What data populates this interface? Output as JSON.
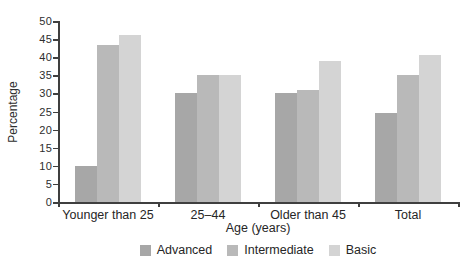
{
  "chart_data": {
    "type": "bar",
    "categories": [
      "Younger than 25",
      "25–44",
      "Older than 45",
      "Total"
    ],
    "series": [
      {
        "name": "Advanced",
        "color": "#a7a7a7",
        "values": [
          10,
          30,
          30,
          24.5
        ]
      },
      {
        "name": "Intermediate",
        "color": "#b9b9b9",
        "values": [
          43.5,
          35,
          31,
          35
        ]
      },
      {
        "name": "Basic",
        "color": "#d4d4d4",
        "values": [
          46,
          35,
          39,
          40.5
        ]
      }
    ],
    "title": "",
    "xlabel": "Age (years)",
    "ylabel": "Percentage",
    "ylim": [
      0,
      50
    ],
    "ytick_step": 5,
    "yticks": [
      "0",
      "5",
      "10",
      "15",
      "20",
      "25",
      "30",
      "35",
      "40",
      "45",
      "50"
    ],
    "grid": false,
    "legend_position": "bottom",
    "axis_color": "#3f3f3f"
  }
}
